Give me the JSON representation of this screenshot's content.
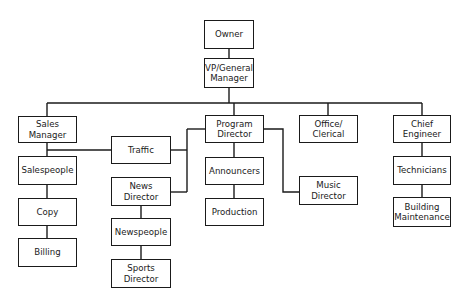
{
  "nodes": {
    "owner": "Owner",
    "vp_general_manager": "VP/General\nManager",
    "sales_manager": "Sales\nManager",
    "program_director": "Program\nDirector",
    "office_clerical": "Office/\nClerical",
    "chief_engineer": "Chief\nEngineer",
    "traffic": "Traffic",
    "salespeople": "Salespeople",
    "copy": "Copy",
    "billing": "Billing",
    "news_director": "News\nDirector",
    "newspeople": "Newspeople",
    "sports_director": "Sports\nDirector",
    "announcers": "Announcers",
    "production": "Production",
    "music_director": "Music\nDirector",
    "technicians": "Technicians",
    "building_maintenance": "Building\nMaintenance"
  },
  "edges": [
    [
      "owner",
      "vp_general_manager"
    ],
    [
      "vp_general_manager",
      "sales_manager"
    ],
    [
      "vp_general_manager",
      "program_director"
    ],
    [
      "vp_general_manager",
      "office_clerical"
    ],
    [
      "vp_general_manager",
      "chief_engineer"
    ],
    [
      "sales_manager",
      "salespeople"
    ],
    [
      "salespeople",
      "copy"
    ],
    [
      "copy",
      "billing"
    ],
    [
      "sales_manager",
      "traffic"
    ],
    [
      "program_director",
      "traffic"
    ],
    [
      "program_director",
      "news_director"
    ],
    [
      "news_director",
      "newspeople"
    ],
    [
      "newspeople",
      "sports_director"
    ],
    [
      "program_director",
      "announcers"
    ],
    [
      "announcers",
      "production"
    ],
    [
      "program_director",
      "music_director"
    ],
    [
      "chief_engineer",
      "technicians"
    ],
    [
      "technicians",
      "building_maintenance"
    ]
  ]
}
